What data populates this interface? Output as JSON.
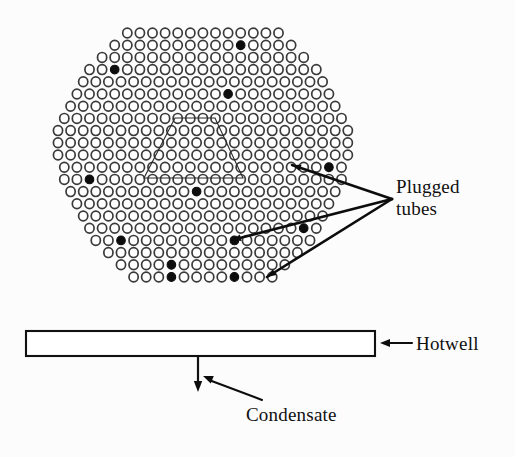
{
  "figure": {
    "kind": "engineering-diagram",
    "background_color": "#fcfcfc",
    "ink_color": "#0d0d0d",
    "tube_outline_color": "#3a3a3a"
  },
  "labels": {
    "plugged_tubes": "Plugged\ntubes",
    "hotwell": "Hotwell",
    "condensate": "Condensate"
  },
  "bundle": {
    "shape": "hexagon",
    "pitch_x": 12.6,
    "pitch_y": 12.2,
    "tube_radius_x": 4.6,
    "tube_radius_y": 4.9,
    "origin_x": 58,
    "origin_y": 33,
    "row_counts": [
      13,
      15,
      17,
      19,
      20,
      21,
      22,
      23,
      24,
      24,
      24,
      23,
      23,
      22,
      21,
      20,
      19,
      18,
      16,
      14,
      12
    ],
    "row_offsets": [
      5.5,
      4.5,
      3.5,
      2.5,
      2.0,
      1.5,
      1.0,
      0.5,
      0.0,
      0.0,
      0.0,
      0.5,
      0.5,
      1.0,
      1.5,
      2.0,
      2.5,
      3.0,
      4.0,
      5.0,
      6.0
    ],
    "total_tubes": 410,
    "plugged_count": 13,
    "plugged_tubes": [
      {
        "row": 1,
        "col": 10
      },
      {
        "row": 3,
        "col": 2
      },
      {
        "row": 5,
        "col": 12
      },
      {
        "row": 11,
        "col": 21
      },
      {
        "row": 12,
        "col": 2
      },
      {
        "row": 13,
        "col": 10
      },
      {
        "row": 16,
        "col": 17
      },
      {
        "row": 17,
        "col": 2
      },
      {
        "row": 17,
        "col": 11
      },
      {
        "row": 18,
        "col": 16
      },
      {
        "row": 19,
        "col": 4
      },
      {
        "row": 20,
        "col": 3
      },
      {
        "row": 20,
        "col": 8
      }
    ]
  },
  "steam_lane": {
    "description": "trapezoidal steam lane outline over tubes",
    "points": "175,118 215,118 243,178 144,178"
  },
  "leaders": {
    "apex_x": 392,
    "apex_y": 199,
    "targets": [
      {
        "name": "upper-right-plugged",
        "x": 292,
        "y": 165
      },
      {
        "name": "middle-right-plugged",
        "x": 232,
        "y": 240
      },
      {
        "name": "lower-right-plugged",
        "x": 267,
        "y": 277
      }
    ]
  },
  "hotwell": {
    "x": 26,
    "y": 331,
    "width": 349,
    "height": 25,
    "arrow_from_x": 412,
    "arrow_to_x": 380,
    "arrow_y": 343
  },
  "condensate": {
    "drain_x": 198,
    "drain_top": 356,
    "drain_bottom": 392,
    "leader_from_x": 262,
    "leader_from_y": 400,
    "leader_to_x": 203,
    "leader_to_y": 376
  }
}
